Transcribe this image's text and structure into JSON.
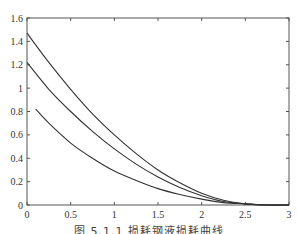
{
  "caption": "图 5.1.1   损耗钢液损耗曲线",
  "chart_data": {
    "type": "line",
    "title": "",
    "xlabel": "",
    "ylabel": "",
    "xlim": [
      0,
      3
    ],
    "ylim": [
      0,
      1.6
    ],
    "grid": false,
    "legend": null,
    "x_ticks": [
      "0",
      "0.5",
      "1",
      "1.5",
      "2",
      "2.5",
      "3"
    ],
    "y_ticks": [
      "0",
      "0.2",
      "0.4",
      "0.6",
      "0.8",
      "1",
      "1.2",
      "1.4",
      "1.6"
    ],
    "series": [
      {
        "name": "curve-1",
        "x": [
          0,
          0.25,
          0.5,
          0.75,
          1.0,
          1.25,
          1.5,
          1.75,
          2.0,
          2.25,
          2.5,
          2.75,
          3.0
        ],
        "y": [
          1.47,
          1.22,
          0.99,
          0.78,
          0.6,
          0.44,
          0.3,
          0.19,
          0.1,
          0.04,
          0.01,
          0.0,
          0.0
        ]
      },
      {
        "name": "curve-2",
        "x": [
          0,
          0.25,
          0.5,
          0.75,
          1.0,
          1.25,
          1.5,
          1.75,
          2.0,
          2.25,
          2.5,
          2.75,
          3.0
        ],
        "y": [
          1.22,
          0.99,
          0.8,
          0.63,
          0.48,
          0.35,
          0.24,
          0.15,
          0.08,
          0.03,
          0.01,
          0.0,
          0.0
        ]
      },
      {
        "name": "curve-3",
        "x": [
          0.1,
          0.25,
          0.5,
          0.75,
          1.0,
          1.25,
          1.5,
          1.75,
          2.0,
          2.25,
          2.5,
          2.75,
          3.0
        ],
        "y": [
          0.82,
          0.7,
          0.53,
          0.4,
          0.29,
          0.21,
          0.14,
          0.09,
          0.05,
          0.02,
          0.01,
          0.0,
          0.0
        ]
      }
    ]
  }
}
